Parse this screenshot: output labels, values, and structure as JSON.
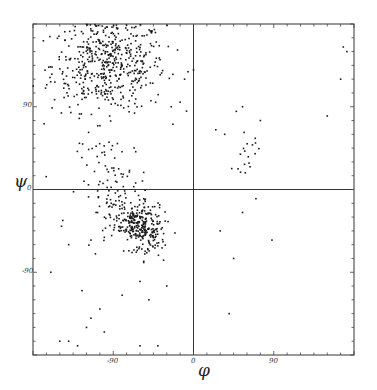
{
  "chart_data": {
    "type": "scatter",
    "title": "",
    "xlabel": "φ",
    "ylabel": "ψ",
    "xlim": [
      -180,
      180
    ],
    "ylim": [
      -180,
      180
    ],
    "x_tick_labels": [
      "-90",
      "0",
      "90"
    ],
    "y_tick_labels": [
      "90",
      "0",
      "-90"
    ],
    "minor_tick_step": 15,
    "grid": false,
    "reference_lines": {
      "phi": 0,
      "psi": 0
    },
    "point_color": "#1a1a1a",
    "clusters": [
      {
        "name": "beta-sheet region",
        "phi_mean": -95,
        "psi_mean": 135,
        "phi_sd": 32,
        "psi_sd": 25,
        "count": 520
      },
      {
        "name": "alpha-helix region",
        "phi_mean": -63,
        "psi_mean": -40,
        "phi_sd": 12,
        "psi_sd": 12,
        "count": 330
      },
      {
        "name": "bridge region",
        "phi_mean": -90,
        "psi_mean": 10,
        "phi_sd": 20,
        "psi_sd": 25,
        "count": 80
      },
      {
        "name": "left-handed helix region",
        "phi_mean": 60,
        "psi_mean": 40,
        "phi_sd": 8,
        "psi_sd": 10,
        "count": 18
      }
    ],
    "outliers": [
      [
        -160,
        -90
      ],
      [
        -150,
        -165
      ],
      [
        -140,
        -165
      ],
      [
        -130,
        -170
      ],
      [
        -120,
        -150
      ],
      [
        -115,
        -140
      ],
      [
        -105,
        -130
      ],
      [
        -100,
        -155
      ],
      [
        -80,
        -115
      ],
      [
        -60,
        -170
      ],
      [
        -50,
        -120
      ],
      [
        -40,
        -170
      ],
      [
        -30,
        -105
      ],
      [
        -125,
        -110
      ],
      [
        -110,
        -70
      ],
      [
        -140,
        -60
      ],
      [
        -148,
        -40
      ],
      [
        -115,
        -55
      ],
      [
        -100,
        -52
      ],
      [
        -60,
        -100
      ],
      [
        30,
        -45
      ],
      [
        55,
        -25
      ],
      [
        70,
        -10
      ],
      [
        88,
        -55
      ],
      [
        40,
        -135
      ],
      [
        45,
        -75
      ],
      [
        68,
        -200
      ],
      [
        25,
        65
      ],
      [
        35,
        60
      ],
      [
        48,
        85
      ],
      [
        55,
        90
      ],
      [
        75,
        75
      ],
      [
        150,
        80
      ],
      [
        165,
        120
      ],
      [
        172,
        150
      ],
      [
        168,
        155
      ],
      [
        -10,
        120
      ],
      [
        0,
        130
      ],
      [
        -15,
        95
      ],
      [
        -25,
        90
      ]
    ]
  },
  "axes": {
    "phi_symbol": "φ",
    "psi_symbol": "ψ",
    "x_ticks": [
      {
        "value": -90,
        "label": "-90"
      },
      {
        "value": 0,
        "label": "0"
      },
      {
        "value": 90,
        "label": "90"
      }
    ],
    "y_ticks": [
      {
        "value": 90,
        "label": "90"
      },
      {
        "value": 0,
        "label": "0"
      },
      {
        "value": -90,
        "label": "-90"
      }
    ]
  }
}
